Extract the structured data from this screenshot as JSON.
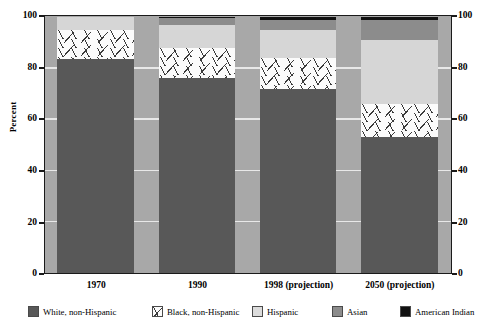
{
  "chart_data": {
    "type": "bar",
    "subtype": "stacked-bar-100-percent",
    "title": "",
    "xlabel": "",
    "ylabel": "Percent",
    "ylim": [
      0,
      100
    ],
    "yticks": [
      0,
      20,
      40,
      60,
      80,
      100
    ],
    "ytick_labels": [
      "0",
      "20",
      "40",
      "60",
      "80",
      "100"
    ],
    "right_axis": true,
    "right_ytick_labels": [
      "0",
      "20",
      "40",
      "60",
      "80",
      "100"
    ],
    "grid": true,
    "legend_position": "bottom",
    "categories": [
      "1970",
      "1990",
      "1998 (projection)",
      "2050 (projection)"
    ],
    "series": [
      {
        "name": "White, non-Hispanic",
        "color": "#585858",
        "pattern": "solid",
        "values": [
          83.5,
          76.0,
          72.0,
          53.0
        ]
      },
      {
        "name": "Black, non-Hispanic",
        "color": "#fbfbfb",
        "pattern": "speckled",
        "values": [
          11.5,
          12.0,
          12.0,
          13.0
        ]
      },
      {
        "name": "Hispanic",
        "color": "#d6d6d6",
        "pattern": "solid",
        "values": [
          5.0,
          9.0,
          11.0,
          25.0
        ]
      },
      {
        "name": "Asian",
        "color": "#8c8c8c",
        "pattern": "solid",
        "values": [
          0.0,
          2.5,
          4.0,
          8.0
        ]
      },
      {
        "name": "American Indian",
        "color": "#111111",
        "pattern": "solid",
        "values": [
          0.0,
          0.5,
          1.0,
          1.0
        ]
      }
    ]
  },
  "axes": {
    "y_title": "Percent",
    "left_ticks": [
      "100",
      "80",
      "60",
      "40",
      "20",
      "0"
    ],
    "right_ticks": [
      "100",
      "80",
      "60",
      "40",
      "20",
      "0"
    ]
  },
  "xaxis": {
    "labels": [
      "1970",
      "1990",
      "1998 (projection)",
      "2050 (projection)"
    ]
  },
  "legend": {
    "items": [
      {
        "label": "White, non-Hispanic",
        "swatch": "white-nh"
      },
      {
        "label": "Black, non-Hispanic",
        "swatch": "black-nh"
      },
      {
        "label": "Hispanic",
        "swatch": "hispanic"
      },
      {
        "label": "Asian",
        "swatch": "asian"
      },
      {
        "label": "American Indian",
        "swatch": "amind"
      }
    ]
  },
  "colors": {
    "plot_background": "#a8a8a8",
    "gridline": "#e8e8e8",
    "frame": "#1a1a1a",
    "white_non_hispanic": "#585858",
    "black_non_hispanic": "#fbfbfb",
    "hispanic": "#d6d6d6",
    "asian": "#8c8c8c",
    "american_indian": "#111111"
  }
}
